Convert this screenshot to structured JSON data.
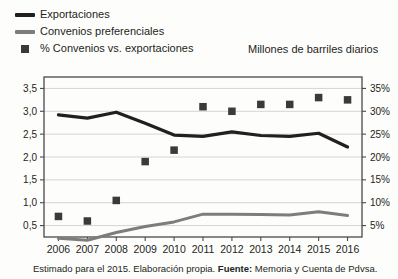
{
  "legend": {
    "items": [
      {
        "label": "Exportaciones",
        "marker": "line",
        "color": "#231f20",
        "name": "legend-item-exportaciones"
      },
      {
        "label": "Convenios preferenciales",
        "marker": "line",
        "color": "#7d7d7d",
        "name": "legend-item-convenios"
      },
      {
        "label": "% Convenios vs. exportaciones",
        "marker": "square",
        "color": "#3a3a3a",
        "name": "legend-item-porcentaje"
      }
    ]
  },
  "unit_caption": "Millones de barriles diarios",
  "footnote": {
    "text_before": "Estimado para el 2015. Elaboración propia. ",
    "bold": "Fuente:",
    "text_after": " Memoria y Cuenta de Pdvsa."
  },
  "axis": {
    "left_ticks": [
      "3,5",
      "3,0",
      "2,5",
      "2,0",
      "1,5",
      "1,0",
      "0,5"
    ],
    "right_ticks": [
      "35%",
      "30%",
      "25%",
      "20%",
      "15%",
      "10%",
      "5%"
    ]
  },
  "colors": {
    "exportaciones": "#231f20",
    "convenios": "#7d7d7d",
    "marker": "#3a3a3a",
    "grid": "#c9c9c9",
    "axis": "#4a4a4a",
    "background": "#fdfdfc"
  },
  "chart_data": {
    "type": "line",
    "title": "",
    "subtitle": "",
    "xlabel": "",
    "ylabel": "Millones de barriles diarios",
    "y2label": "% Convenios vs. exportaciones",
    "grid": true,
    "legend_position": "top-left",
    "categories": [
      "2006",
      "2007",
      "2008",
      "2009",
      "2010",
      "2011",
      "2012",
      "2013",
      "2014",
      "2015",
      "2016"
    ],
    "ylim": [
      0.25,
      3.75
    ],
    "y2lim": [
      2.5,
      37.5
    ],
    "yticks": [
      0.5,
      1.0,
      1.5,
      2.0,
      2.5,
      3.0,
      3.5
    ],
    "y2ticks": [
      5,
      10,
      15,
      20,
      25,
      30,
      35
    ],
    "series": [
      {
        "name": "Exportaciones",
        "type": "line",
        "axis": "left",
        "color": "#231f20",
        "values": [
          2.92,
          2.85,
          2.98,
          2.74,
          2.48,
          2.45,
          2.55,
          2.47,
          2.45,
          2.52,
          2.22
        ]
      },
      {
        "name": "Convenios preferenciales",
        "type": "line",
        "axis": "left",
        "color": "#7d7d7d",
        "values": [
          0.22,
          0.18,
          0.35,
          0.48,
          0.58,
          0.75,
          0.75,
          0.74,
          0.73,
          0.8,
          0.72
        ]
      },
      {
        "name": "% Convenios vs. exportaciones",
        "type": "scatter",
        "axis": "right",
        "color": "#3a3a3a",
        "values": [
          7.0,
          6.0,
          10.5,
          19.0,
          21.5,
          31.0,
          30.0,
          31.5,
          31.5,
          33.0,
          32.5
        ]
      }
    ]
  }
}
